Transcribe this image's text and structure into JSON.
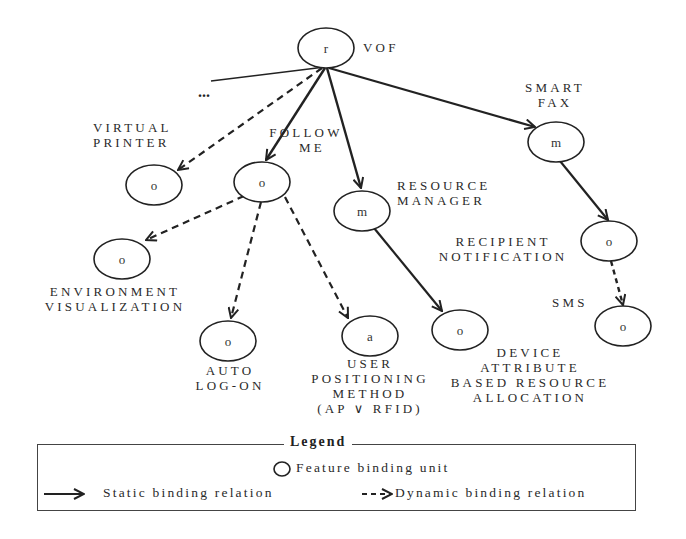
{
  "diagram": {
    "root": {
      "letter": "r",
      "label": "VOF"
    },
    "ellipsis": "...",
    "nodes": {
      "virtual_printer": {
        "letter": "o",
        "label_lines": [
          "VIRTUAL",
          "PRINTER"
        ]
      },
      "follow_me": {
        "letter": "o",
        "label_lines": [
          "FOLLOW",
          "ME"
        ]
      },
      "resource_manager": {
        "letter": "m",
        "label_lines": [
          "RESOURCE",
          "MANAGER"
        ]
      },
      "smart_fax": {
        "letter": "m",
        "label_lines": [
          "SMART",
          "FAX"
        ]
      },
      "recipient_notification": {
        "letter": "o",
        "label_lines": [
          "RECIPIENT",
          "NOTIFICATION"
        ]
      },
      "sms": {
        "letter": "o",
        "label_lines": [
          "SMS"
        ]
      },
      "environment_visualization": {
        "letter": "o",
        "label_lines": [
          "ENVIRONMENT",
          "VISUALIZATION"
        ]
      },
      "auto_log_on": {
        "letter": "o",
        "label_lines": [
          "AUTO",
          "LOG-ON"
        ]
      },
      "user_positioning_method": {
        "letter": "a",
        "label_lines": [
          "USER",
          "POSITIONING",
          "METHOD",
          "(AP ∨ RFID)"
        ]
      },
      "device_attribute": {
        "letter": "o",
        "label_lines": [
          "DEVICE",
          "ATTRIBUTE",
          "BASED RESOURCE",
          "ALLOCATION"
        ]
      }
    },
    "edges": [
      {
        "from": "root",
        "to": "virtual_printer",
        "type": "dynamic"
      },
      {
        "from": "root",
        "to": "follow_me",
        "type": "static"
      },
      {
        "from": "root",
        "to": "resource_manager",
        "type": "static"
      },
      {
        "from": "root",
        "to": "smart_fax",
        "type": "static"
      },
      {
        "from": "follow_me",
        "to": "environment_visualization",
        "type": "dynamic"
      },
      {
        "from": "follow_me",
        "to": "auto_log_on",
        "type": "dynamic"
      },
      {
        "from": "follow_me",
        "to": "user_positioning_method",
        "type": "dynamic"
      },
      {
        "from": "resource_manager",
        "to": "device_attribute",
        "type": "static"
      },
      {
        "from": "smart_fax",
        "to": "recipient_notification",
        "type": "static"
      },
      {
        "from": "recipient_notification",
        "to": "sms",
        "type": "dynamic"
      }
    ]
  },
  "legend": {
    "title": "Legend",
    "feature_unit": "Feature binding unit",
    "static": "Static binding relation",
    "dynamic": "Dynamic binding relation"
  }
}
